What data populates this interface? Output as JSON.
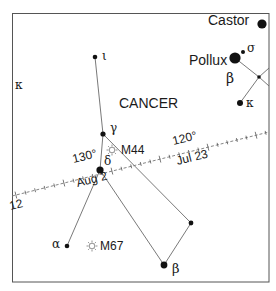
{
  "chart": {
    "title": "",
    "constellation_label": "CANCER",
    "colors": {
      "background": "#ffffff",
      "frame": "#555555",
      "lines": "#666666",
      "stars": "#111111",
      "text": "#1a1a1a"
    },
    "frame": {
      "x": 12,
      "y": 13,
      "width": 257,
      "height": 269
    }
  },
  "stars": [
    {
      "id": "iota-cnc",
      "label": "ι",
      "x": 95,
      "y": 57,
      "r": 2.3
    },
    {
      "id": "gamma-cnc",
      "label": "γ",
      "x": 103,
      "y": 134,
      "r": 2.6
    },
    {
      "id": "delta-cnc",
      "label": "δ",
      "x": 100,
      "y": 170,
      "r": 3.6
    },
    {
      "id": "alpha-cnc",
      "label": "α",
      "x": 67,
      "y": 246,
      "r": 2.3
    },
    {
      "id": "beta-cnc",
      "label": "β",
      "x": 164,
      "y": 265,
      "r": 3.4
    },
    {
      "id": "star-unlabeled",
      "label": "",
      "x": 191,
      "y": 223,
      "r": 2.4
    },
    {
      "id": "pollux",
      "label": "Pollux",
      "x": 235,
      "y": 58,
      "r": 5.6
    },
    {
      "id": "sigma-gem",
      "label": "σ",
      "x": 243,
      "y": 52,
      "r": 2.0
    },
    {
      "id": "gem-junction",
      "label": "",
      "x": 259,
      "y": 77,
      "r": 1.8
    },
    {
      "id": "kappa-gem",
      "label": "κ",
      "x": 240,
      "y": 103,
      "r": 3.0
    },
    {
      "id": "castor",
      "label": "Castor",
      "x": 262,
      "y": 24,
      "r": 4.6
    }
  ],
  "labels": {
    "constellation": "CANCER",
    "iota": "ι",
    "kappa_left": "κ",
    "gamma": "γ",
    "delta": "δ",
    "alpha": "α",
    "beta_cnc": "β",
    "beta_gem": "β",
    "sigma_gem": "σ",
    "kappa_gem": "κ",
    "pollux": "Pollux",
    "castor": "Castor",
    "m44": "M44",
    "m67": "M67",
    "deg_130": "130°",
    "deg_120": "120°",
    "date_aug2": "Aug 2",
    "date_jul23": "Jul 23",
    "edge_12": "12"
  },
  "clusters": [
    {
      "id": "M44",
      "symbol": "☼",
      "x": 112,
      "y": 150
    },
    {
      "id": "M67",
      "symbol": "☼",
      "x": 92,
      "y": 246
    }
  ],
  "ecliptic": {
    "start": [
      12,
      196
    ],
    "end": [
      269,
      132
    ],
    "tick_spacing_deg": 1,
    "major_ticks": [
      {
        "label": "130°",
        "date": "Aug 2"
      },
      {
        "label": "120°",
        "date": "Jul 23"
      }
    ]
  }
}
